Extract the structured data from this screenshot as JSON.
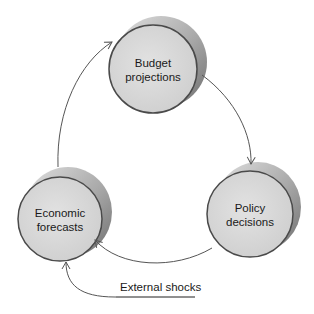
{
  "diagram": {
    "type": "cycle",
    "nodes": [
      {
        "id": "budget",
        "line1": "Budget",
        "line2": "projections"
      },
      {
        "id": "policy",
        "line1": "Policy",
        "line2": "decisions"
      },
      {
        "id": "economic",
        "line1": "Economic",
        "line2": "forecasts"
      }
    ],
    "edges": [
      {
        "from": "economic",
        "to": "budget"
      },
      {
        "from": "budget",
        "to": "policy"
      },
      {
        "from": "policy",
        "to": "economic"
      },
      {
        "from": "external",
        "to": "economic"
      }
    ],
    "external_input": {
      "label": "External shocks"
    }
  },
  "colors": {
    "face": "#d9d9d9",
    "edge": "#444444",
    "side": "#9a9a9a",
    "arrow": "#555555"
  }
}
